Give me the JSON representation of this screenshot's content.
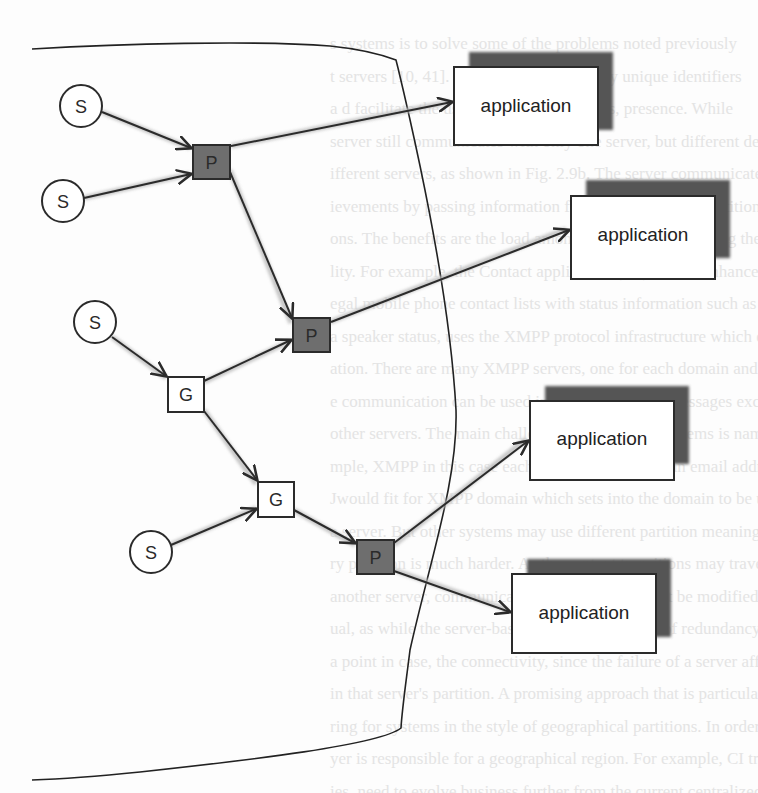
{
  "figure": {
    "type": "network-diagram",
    "node_legend": {
      "S": "sensor",
      "G": "gateway",
      "P": "processor",
      "application": "application"
    },
    "colors": {
      "line": "#2b2b2b",
      "processor_fill": "#6e6e6e",
      "gateway_fill": "#ffffff",
      "sensor_fill": "#ffffff",
      "app_shadow": "#555555",
      "edge_shadow": "#b5b5b5",
      "background": "#fdfdfd"
    }
  },
  "nodes": {
    "s1": {
      "label": "S",
      "kind": "sensor"
    },
    "s2": {
      "label": "S",
      "kind": "sensor"
    },
    "s3": {
      "label": "S",
      "kind": "sensor"
    },
    "s4": {
      "label": "S",
      "kind": "sensor"
    },
    "p1": {
      "label": "P",
      "kind": "processor"
    },
    "p2": {
      "label": "P",
      "kind": "processor"
    },
    "p3": {
      "label": "P",
      "kind": "processor"
    },
    "g1": {
      "label": "G",
      "kind": "gateway"
    },
    "g2": {
      "label": "G",
      "kind": "gateway"
    },
    "app1": {
      "label": "application",
      "kind": "application"
    },
    "app2": {
      "label": "application",
      "kind": "application"
    },
    "app3": {
      "label": "application",
      "kind": "application"
    },
    "app4": {
      "label": "application",
      "kind": "application"
    }
  },
  "edges": [
    {
      "from": "s1",
      "to": "p1"
    },
    {
      "from": "s2",
      "to": "p1"
    },
    {
      "from": "p1",
      "to": "app1"
    },
    {
      "from": "p1",
      "to": "p2"
    },
    {
      "from": "s3",
      "to": "g1"
    },
    {
      "from": "g1",
      "to": "p2"
    },
    {
      "from": "p2",
      "to": "app2"
    },
    {
      "from": "g1",
      "to": "g2"
    },
    {
      "from": "s4",
      "to": "g2"
    },
    {
      "from": "g2",
      "to": "p3"
    },
    {
      "from": "p3",
      "to": "app3"
    },
    {
      "from": "p3",
      "to": "app4"
    }
  ],
  "background_text": [
    "s systems is to solve some of the problems noted previously",
    "t servers [10, 41]. In this approach, locally unique identifiers",
    "a d facilitate the use of different partitions, presence. While",
    "server still communicates with only one server, but different devices",
    "ifferent servers, as shown in Fig. 2.9b. The server communicates the",
    "ievements by passing information from devices in one partition",
    "ons. The benefits are the load among the servers, increasing the",
    "lity. For example, the Contact application (2.2), which enhanced",
    "egal mobile phone contact lists with status information such as location",
    "a speaker status, uses the XMPP protocol infrastructure which enab",
    "ation. There are many XMPP servers, one for each domain and the",
    "e communication can be used in a way which the messages exchange",
    "other servers. The main challenge of partitioned systems is naming in",
    "mple, XMPP in this case each user identifier is in an email address",
    "Jwould fit for XMPP domain which sets into the domain to be used",
    "a server. But other systems may use different partition meaning. For",
    "ry partition is much harder. As the context transitions may travel",
    "another server, communications in the server must be modified in",
    "ual, as while the server-based approach, the lack of redundancy creates",
    "a point in case, the connectivity, since the failure of a server affects all",
    "in that server's partition. A promising approach that is particularly",
    "ring for systems in the style of geographical partitions. In order to support",
    "yer is responsible for a geographical region. For example, CI tracking",
    "ies, need to evolve business further from the current centralized model"
  ]
}
